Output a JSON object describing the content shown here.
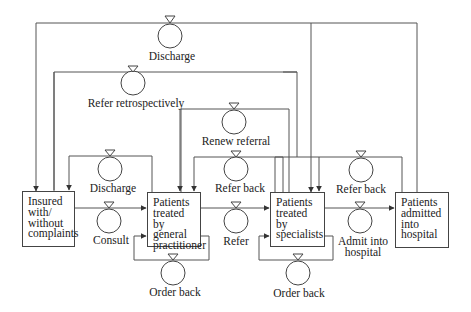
{
  "diagram": {
    "type": "stock-flow",
    "stocks": [
      {
        "id": "insured",
        "label": "Insured\nwith/\nwithout\ncomplaints"
      },
      {
        "id": "gp",
        "label": "Patients\ntreated\nby general\npractitioner"
      },
      {
        "id": "specialists",
        "label": "Patients\ntreated\nby\nspecialists"
      },
      {
        "id": "hospital",
        "label": "Patients\nadmitted\ninto\nhospital"
      }
    ],
    "flows": [
      {
        "id": "discharge_top",
        "label": "Discharge",
        "from": "hospital",
        "to": "insured"
      },
      {
        "id": "refer_retro",
        "label": "Refer retrospectively",
        "from": "hospital",
        "to": "gp"
      },
      {
        "id": "renew_referral",
        "label": "Renew referral",
        "from": "gp",
        "to": "specialists"
      },
      {
        "id": "discharge_gp",
        "label": "Discharge",
        "from": "gp",
        "to": "insured"
      },
      {
        "id": "refer_back_gp",
        "label": "Refer back",
        "from": "specialists",
        "to": "gp"
      },
      {
        "id": "refer_back_spec",
        "label": "Refer back",
        "from": "hospital",
        "to": "specialists"
      },
      {
        "id": "consult",
        "label": "Consult",
        "from": "insured",
        "to": "gp"
      },
      {
        "id": "refer",
        "label": "Refer",
        "from": "gp",
        "to": "specialists"
      },
      {
        "id": "admit",
        "label": "Admit into\nhospital",
        "from": "specialists",
        "to": "hospital"
      },
      {
        "id": "order_back_gp",
        "label": "Order back",
        "from": "gp",
        "to": "gp"
      },
      {
        "id": "order_back_spec",
        "label": "Order back",
        "from": "specialists",
        "to": "specialists"
      }
    ]
  },
  "labels": {
    "discharge_top": "Discharge",
    "refer_retro": "Refer retrospectively",
    "renew_referral": "Renew referral",
    "discharge_gp": "Discharge",
    "refer_back_gp": "Refer back",
    "refer_back_spec": "Refer back",
    "consult": "Consult",
    "refer": "Refer",
    "admit_line1": "Admit into",
    "admit_line2": "hospital",
    "order_back_gp": "Order back",
    "order_back_spec": "Order back"
  },
  "boxes": {
    "insured": "Insured\nwith/\nwithout\ncomplaints",
    "gp": "Patients\ntreated\nby general\npractitioner",
    "specialists": "Patients\ntreated\nby\nspecialists",
    "hospital": "Patients\nadmitted\ninto\nhospital"
  },
  "colors": {
    "line": "#444444",
    "background": "#ffffff"
  }
}
